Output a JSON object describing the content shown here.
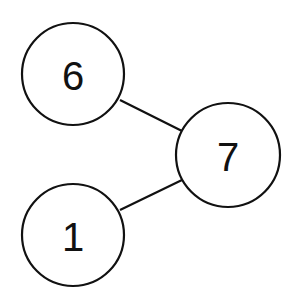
{
  "diagram": {
    "type": "graph",
    "nodes": [
      {
        "id": "n6",
        "label": "6",
        "cx": 73,
        "cy": 74,
        "r": 51
      },
      {
        "id": "n7",
        "label": "7",
        "cx": 228,
        "cy": 155,
        "r": 52
      },
      {
        "id": "n1",
        "label": "1",
        "cx": 73,
        "cy": 235,
        "r": 51
      }
    ],
    "edges": [
      {
        "from": "6",
        "to": "7"
      },
      {
        "from": "1",
        "to": "7"
      }
    ],
    "colors": {
      "stroke": "#111111",
      "fill": "#ffffff",
      "background": "#ffffff"
    }
  }
}
